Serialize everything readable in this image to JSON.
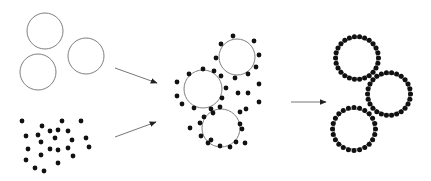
{
  "diagram": {
    "type": "process-flow",
    "colors": {
      "background": "#ffffff",
      "circle_stroke": "#808080",
      "dot": "#111111",
      "arrow": "#777777",
      "arrowhead": "#222222"
    },
    "stages": [
      {
        "name": "inputs",
        "groups": [
          {
            "name": "large-spheres",
            "circles": [
              {
                "cx": 45,
                "cy": 31,
                "r": 18
              },
              {
                "cx": 86,
                "cy": 56,
                "r": 18
              },
              {
                "cx": 38,
                "cy": 72,
                "r": 18
              }
            ]
          },
          {
            "name": "small-particles",
            "dots": [
              [
                22,
                121
              ],
              [
                42,
                126
              ],
              [
                62,
                121
              ],
              [
                81,
                121
              ],
              [
                26,
                136
              ],
              [
                38,
                135
              ],
              [
                50,
                131
              ],
              [
                58,
                130
              ],
              [
                68,
                131
              ],
              [
                41,
                142
              ],
              [
                55,
                138
              ],
              [
                72,
                140
              ],
              [
                86,
                138
              ],
              [
                28,
                149
              ],
              [
                50,
                149
              ],
              [
                58,
                150
              ],
              [
                68,
                148
              ],
              [
                89,
                147
              ],
              [
                41,
                155
              ],
              [
                73,
                156
              ],
              [
                26,
                160
              ],
              [
                58,
                163
              ],
              [
                35,
                168
              ],
              [
                44,
                171
              ]
            ]
          }
        ]
      },
      {
        "name": "mixed",
        "circles": [
          {
            "cx": 237,
            "cy": 57,
            "r": 18
          },
          {
            "cx": 203,
            "cy": 89,
            "r": 19
          },
          {
            "cx": 221,
            "cy": 128,
            "r": 19
          }
        ],
        "dots": [
          [
            233,
            36
          ],
          [
            221,
            44
          ],
          [
            254,
            41
          ],
          [
            259,
            55
          ],
          [
            216,
            58
          ],
          [
            256,
            67
          ],
          [
            235,
            78
          ],
          [
            248,
            74
          ],
          [
            203,
            69
          ],
          [
            189,
            74
          ],
          [
            214,
            71
          ],
          [
            221,
            76
          ],
          [
            177,
            82
          ],
          [
            182,
            104
          ],
          [
            177,
            96
          ],
          [
            226,
            88
          ],
          [
            222,
            98
          ],
          [
            220,
            107
          ],
          [
            194,
            108
          ],
          [
            211,
            109
          ],
          [
            238,
            93
          ],
          [
            248,
            93
          ],
          [
            259,
            84
          ],
          [
            259,
            102
          ],
          [
            204,
            117
          ],
          [
            213,
            113
          ],
          [
            240,
            112
          ],
          [
            246,
            109
          ],
          [
            200,
            123
          ],
          [
            240,
            124
          ],
          [
            190,
            128
          ],
          [
            242,
            129
          ],
          [
            201,
            136
          ],
          [
            211,
            140
          ],
          [
            208,
            143
          ],
          [
            220,
            146
          ],
          [
            230,
            147
          ],
          [
            236,
            142
          ],
          [
            245,
            143
          ]
        ]
      },
      {
        "name": "coated",
        "circles": [
          {
            "cx": 357,
            "cy": 58,
            "r": 20
          },
          {
            "cx": 389,
            "cy": 94,
            "r": 20
          },
          {
            "cx": 354,
            "cy": 129,
            "r": 20
          }
        ],
        "dot_counts": [
          26,
          26,
          24
        ]
      }
    ],
    "arrows": [
      {
        "name": "arrow-spheres-to-mix",
        "x1": 115,
        "y1": 68,
        "x2": 157,
        "y2": 83
      },
      {
        "name": "arrow-particles-to-mix",
        "x1": 115,
        "y1": 137,
        "x2": 156,
        "y2": 122
      },
      {
        "name": "arrow-mix-to-coated",
        "x1": 291,
        "y1": 102,
        "x2": 326,
        "y2": 102
      }
    ]
  }
}
